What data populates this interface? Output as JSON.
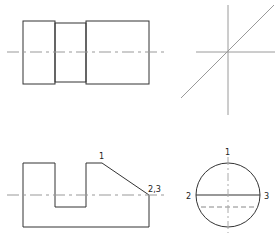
{
  "diagram": {
    "type": "orthographic-projection",
    "views": {
      "front": {
        "name": "front-view"
      },
      "top": {
        "name": "top-view"
      },
      "side": {
        "name": "side-view"
      },
      "miter": {
        "name": "miter-line"
      }
    },
    "labels": {
      "top_point_1": "1",
      "top_point_23": "2,3",
      "side_point_1": "1",
      "side_point_2": "2",
      "side_point_3": "3"
    },
    "colors": {
      "line": "#333333",
      "construction": "#9a9a9a"
    }
  }
}
